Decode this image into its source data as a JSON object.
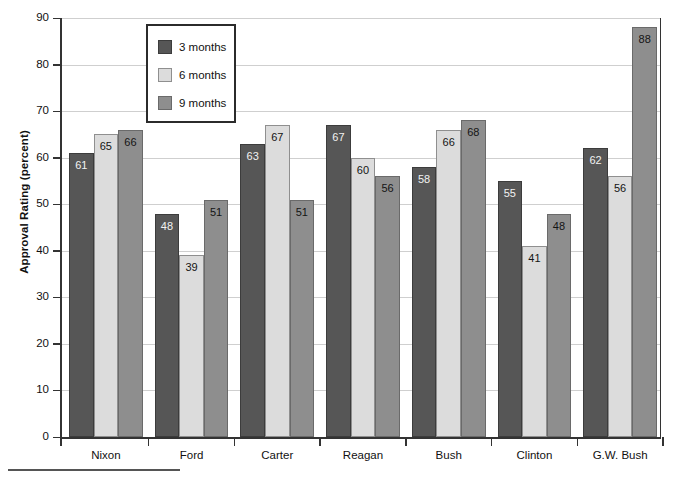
{
  "chart_data": {
    "type": "bar",
    "title": "",
    "xlabel": "",
    "ylabel": "Approval Rating (percent)",
    "ylim": [
      0,
      90
    ],
    "ytick_step": 10,
    "yticks": [
      0,
      10,
      20,
      30,
      40,
      50,
      60,
      70,
      80,
      90
    ],
    "grid": true,
    "legend_position": "top-left-inside",
    "categories": [
      "Nixon",
      "Ford",
      "Carter",
      "Reagan",
      "Bush",
      "Clinton",
      "G.W. Bush"
    ],
    "series": [
      {
        "name": "3 months",
        "color": "#565656",
        "values": [
          61,
          48,
          63,
          67,
          58,
          55,
          62
        ]
      },
      {
        "name": "6 months",
        "color": "#dcdcdc",
        "values": [
          65,
          39,
          67,
          60,
          66,
          41,
          56
        ]
      },
      {
        "name": "9 months",
        "color": "#8e8e8e",
        "values": [
          66,
          51,
          51,
          56,
          68,
          48,
          88
        ]
      }
    ]
  },
  "axes": {
    "y_title": "Approval Rating (percent)"
  },
  "legend": {
    "items": [
      {
        "label": "3 months"
      },
      {
        "label": "6 months"
      },
      {
        "label": "9 months"
      }
    ]
  }
}
